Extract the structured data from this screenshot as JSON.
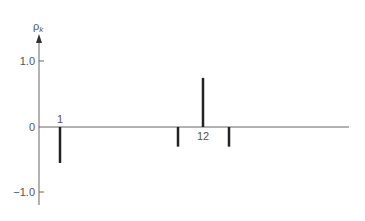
{
  "chart_data": {
    "type": "bar",
    "subtype": "autocorrelation-spike-plot",
    "title": "",
    "ylabel": "ρk",
    "xlabel": "",
    "ylim": [
      -1.2,
      1.2
    ],
    "yticks": [
      -1.0,
      0,
      1.0
    ],
    "ytick_labels": [
      "−1.0",
      "0",
      "1.0"
    ],
    "grid": false,
    "legend": null,
    "x": [
      1,
      11,
      12,
      13
    ],
    "values": [
      -0.55,
      -0.3,
      0.75,
      -0.3
    ],
    "annotations": [
      {
        "text": "1",
        "at_lag": 1
      },
      {
        "text": "12",
        "at_lag": 12
      }
    ],
    "colors": {
      "spike": "#222222",
      "axis": "#666666",
      "text": "#555555"
    }
  },
  "labels": {
    "y_axis": "ρ",
    "y_axis_sub": "k",
    "tick_pos": "1.0",
    "tick_zero": "0",
    "tick_neg": "−1.0",
    "lag1": "1",
    "lag12": "12"
  }
}
